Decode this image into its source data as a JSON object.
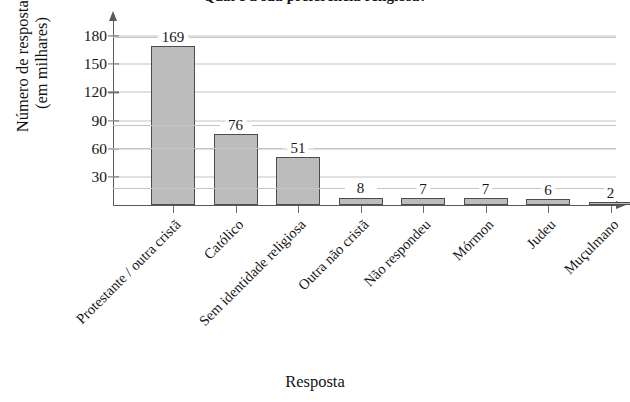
{
  "chart_data": {
    "type": "bar",
    "title": "Qual é a sua preferência religiosa?",
    "xlabel": "Resposta",
    "ylabel_line1": "Número de respostas",
    "ylabel_line2": "(em milhares)",
    "categories": [
      "Protestante / outra cristã",
      "Católico",
      "Sem identidade religiosa",
      "Outra não cristã",
      "Não respondeu",
      "Mórmon",
      "Judeu",
      "Muçulmano"
    ],
    "values": [
      169,
      76,
      51,
      8,
      7,
      7,
      6,
      2
    ],
    "value_labels": [
      "169",
      "76",
      "51",
      "8",
      "7",
      "7",
      "6",
      "2"
    ],
    "yticks": [
      30,
      60,
      90,
      120,
      150,
      180
    ],
    "ytick_labels": [
      "30",
      "60",
      "90",
      "120",
      "150",
      "180"
    ],
    "ylim": [
      0,
      195
    ],
    "grid": "horizontal",
    "legend": "none",
    "bar_fill_color": "#bcbcbc",
    "bar_edge_color": "#4c4c4c",
    "grid_color": "#c4c4c4",
    "axis_color": "#5a5a5a"
  }
}
